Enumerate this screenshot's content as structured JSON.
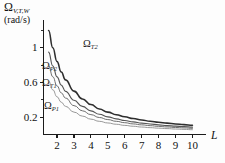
{
  "chart_data": {
    "type": "line",
    "title": "",
    "ylabel_symbol": "Ω",
    "ylabel_subscript": "V,T,W",
    "ylabel_units": "(rad/s)",
    "xlabel": "L",
    "xlim": [
      1.2,
      10.8
    ],
    "ylim": [
      0,
      1.32
    ],
    "grid": false,
    "legend_position": "inline-curve-labels",
    "xticks": [
      2,
      3,
      4,
      5,
      6,
      7,
      8,
      9,
      10
    ],
    "xtick_labels": [
      "2",
      "3",
      "4",
      "5",
      "6",
      "7",
      "8",
      "9",
      "10"
    ],
    "yticks": [
      0.2,
      0.6,
      1
    ],
    "ytick_labels": [
      "0.2",
      "0.6",
      "1"
    ],
    "yminor_ticks": [
      0.4,
      0.8,
      1.2
    ],
    "x": [
      1.5,
      1.75,
      2,
      2.25,
      2.5,
      3,
      3.5,
      4,
      4.5,
      5,
      5.5,
      6,
      6.5,
      7,
      7.5,
      8,
      8.5,
      9,
      9.5,
      10
    ],
    "series": [
      {
        "name": "Ω_T2",
        "label_symbol": "Ω",
        "label_subscript": "T2",
        "color": "#2e2e2e",
        "values": [
          1.2,
          1.0,
          0.84,
          0.72,
          0.63,
          0.5,
          0.41,
          0.345,
          0.295,
          0.258,
          0.228,
          0.204,
          0.184,
          0.167,
          0.153,
          0.141,
          0.131,
          0.122,
          0.114,
          0.107
        ]
      },
      {
        "name": "Ω_P2",
        "label_symbol": "Ω",
        "label_subscript": "P2",
        "color": "#555555",
        "values": [
          0.95,
          0.79,
          0.665,
          0.57,
          0.498,
          0.395,
          0.324,
          0.272,
          0.233,
          0.204,
          0.18,
          0.161,
          0.145,
          0.132,
          0.121,
          0.111,
          0.103,
          0.096,
          0.09,
          0.085
        ]
      },
      {
        "name": "Ω_T1",
        "label_symbol": "Ω",
        "label_subscript": "T1",
        "color": "#6e6e6e",
        "values": [
          0.8,
          0.665,
          0.56,
          0.48,
          0.42,
          0.333,
          0.273,
          0.229,
          0.196,
          0.172,
          0.152,
          0.136,
          0.122,
          0.111,
          0.102,
          0.094,
          0.087,
          0.081,
          0.076,
          0.071
        ]
      },
      {
        "name": "Ω_P1",
        "label_symbol": "Ω",
        "label_subscript": "P1",
        "color": "#8c8c8c",
        "values": [
          0.62,
          0.515,
          0.435,
          0.372,
          0.325,
          0.258,
          0.212,
          0.177,
          0.152,
          0.133,
          0.118,
          0.105,
          0.095,
          0.086,
          0.079,
          0.073,
          0.068,
          0.063,
          0.059,
          0.055
        ]
      }
    ]
  },
  "axis": {
    "y_label_symbol": "Ω",
    "y_label_subscript": "V,T,W",
    "y_label_units": "(rad/s)",
    "x_label": "L"
  }
}
